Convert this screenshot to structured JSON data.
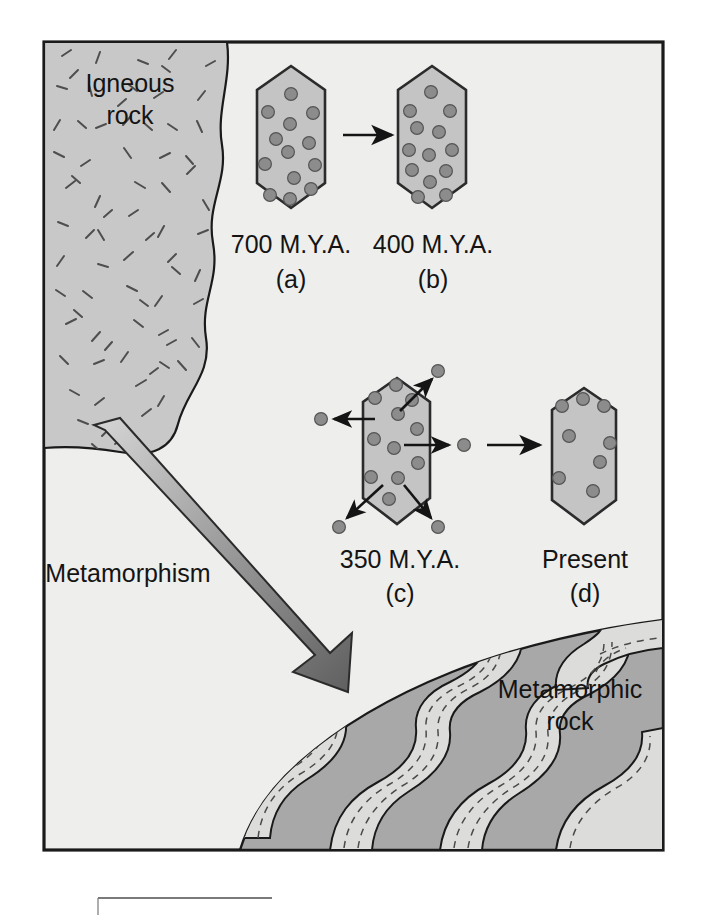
{
  "figure": {
    "name": "radiometric-decay-metamorphism-diagram",
    "frame": {
      "x": 42,
      "y": 40,
      "width": 623,
      "height": 812
    },
    "colors": {
      "background": "#eeeeec",
      "igneous_rock": "#c8c8c8",
      "crystal_fill": "#c4c4c4",
      "crystal_stroke": "#2b2b2b",
      "atom_fill": "#8c8c8c",
      "atom_stroke": "#4a4a4a",
      "metamorphic_dark": "#a8a8a8",
      "metamorphic_band": "#dcdcda",
      "outline": "#1a1a1a",
      "arrow_dark": "#6e6e6e",
      "arrow_light": "#d2d2d2",
      "caption_rule": "#7a7a7a"
    }
  },
  "regions": {
    "igneous": {
      "label_line1": "Igneous",
      "label_line2": "rock",
      "x": 130,
      "y": 92
    },
    "metamorphic": {
      "label_line1": "Metamorphic",
      "label_line2": "rock",
      "x": 570,
      "y": 690
    }
  },
  "process_arrow": {
    "label": "Metamorphism",
    "label_x": 128,
    "label_y": 580
  },
  "stages": [
    {
      "id": "a",
      "time_label": "700 M.Y.A.",
      "panel_label": "(a)",
      "cx": 291,
      "cy": 137,
      "atom_count": 13,
      "atoms": [
        [
          291,
          95
        ],
        [
          269,
          113
        ],
        [
          313,
          113
        ],
        [
          291,
          125
        ],
        [
          289,
          153
        ],
        [
          266,
          165
        ],
        [
          315,
          166
        ],
        [
          295,
          180
        ],
        [
          271,
          196
        ],
        [
          312,
          190
        ],
        [
          291,
          200
        ],
        [
          276,
          140
        ],
        [
          308,
          143
        ]
      ]
    },
    {
      "id": "b",
      "time_label": "400 M.Y.A.",
      "panel_label": "(b)",
      "cx": 433,
      "cy": 137,
      "atom_count": 13,
      "atoms": [
        [
          431,
          92
        ],
        [
          411,
          112
        ],
        [
          451,
          112
        ],
        [
          418,
          129
        ],
        [
          438,
          132
        ],
        [
          409,
          150
        ],
        [
          451,
          150
        ],
        [
          429,
          155
        ],
        [
          413,
          171
        ],
        [
          446,
          172
        ],
        [
          431,
          183
        ],
        [
          419,
          198
        ],
        [
          446,
          196
        ]
      ]
    },
    {
      "id": "c",
      "time_label": "350 M.Y.A.",
      "panel_label": "(c)",
      "cx": 400,
      "cy": 452,
      "atom_count": 11,
      "atoms": [
        [
          396,
          382
        ],
        [
          375,
          397
        ],
        [
          413,
          399
        ],
        [
          398,
          412
        ],
        [
          418,
          428
        ],
        [
          374,
          438
        ],
        [
          394,
          447
        ],
        [
          419,
          463
        ],
        [
          371,
          477
        ],
        [
          398,
          478
        ],
        [
          389,
          498
        ]
      ],
      "escaped_atoms": [
        {
          "x": 320,
          "y": 418,
          "direction": "left"
        },
        {
          "x": 464,
          "y": 445,
          "direction": "right"
        },
        {
          "x": 437,
          "y": 372,
          "direction": "up-right"
        },
        {
          "x": 339,
          "y": 526,
          "direction": "down-left"
        },
        {
          "x": 438,
          "y": 527,
          "direction": "down-right"
        }
      ]
    },
    {
      "id": "d",
      "time_label": "Present",
      "panel_label": "(d)",
      "cx": 585,
      "cy": 452,
      "atom_count": 8,
      "atoms": [
        [
          583,
          400
        ],
        [
          562,
          404
        ],
        [
          604,
          404
        ],
        [
          569,
          434
        ],
        [
          611,
          443
        ],
        [
          590,
          455
        ],
        [
          558,
          478
        ],
        [
          596,
          488
        ]
      ]
    }
  ],
  "labels": {
    "time_row_y": 245,
    "panel_row_y": 278,
    "time_row2_y": 560,
    "panel_row2_y": 592
  }
}
